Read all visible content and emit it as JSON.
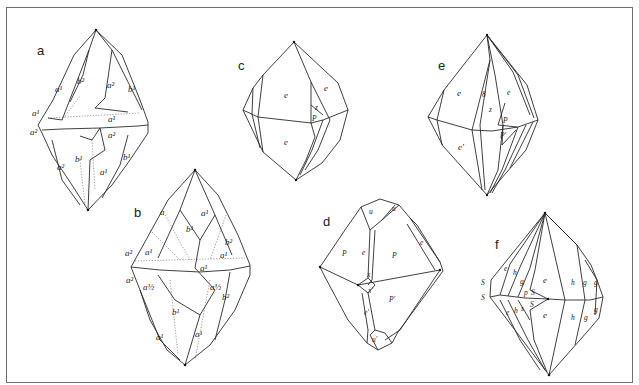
{
  "figure": {
    "type": "crystal-habit-drawings",
    "panels": [
      {
        "id": "a",
        "label": "a",
        "face_labels": [
          "a¹",
          "b²",
          "a²",
          "b¹",
          "a¹",
          "a¹",
          "a²",
          "a²",
          "b¹",
          "a²",
          "b¹",
          "a¹",
          "a¹"
        ]
      },
      {
        "id": "b",
        "label": "b",
        "face_labels": [
          "a",
          "b¹",
          "a¹",
          "a¹",
          "a²",
          "b²",
          "a¹",
          "a¹",
          "a²",
          "a½",
          "a½",
          "b²",
          "b¹",
          "a¹",
          "a¹"
        ]
      },
      {
        "id": "c",
        "label": "c",
        "face_labels": [
          "e",
          "e",
          "z",
          "P",
          "e"
        ]
      },
      {
        "id": "d",
        "label": "d",
        "face_labels": [
          "u",
          "u",
          "P",
          "e",
          "P",
          "e",
          "x",
          "x′",
          "P′",
          "e′",
          "u′"
        ]
      },
      {
        "id": "e",
        "label": "e",
        "face_labels": [
          "e",
          "8",
          "e",
          "z",
          "P",
          "P′",
          "e′"
        ]
      },
      {
        "id": "f",
        "label": "f",
        "face_labels": [
          "S",
          "S",
          "e",
          "h",
          "g",
          "p",
          "S",
          "e",
          "h",
          "g",
          "g",
          "S",
          "e",
          "h",
          "g",
          "g",
          "e",
          "h",
          "s"
        ]
      }
    ]
  }
}
